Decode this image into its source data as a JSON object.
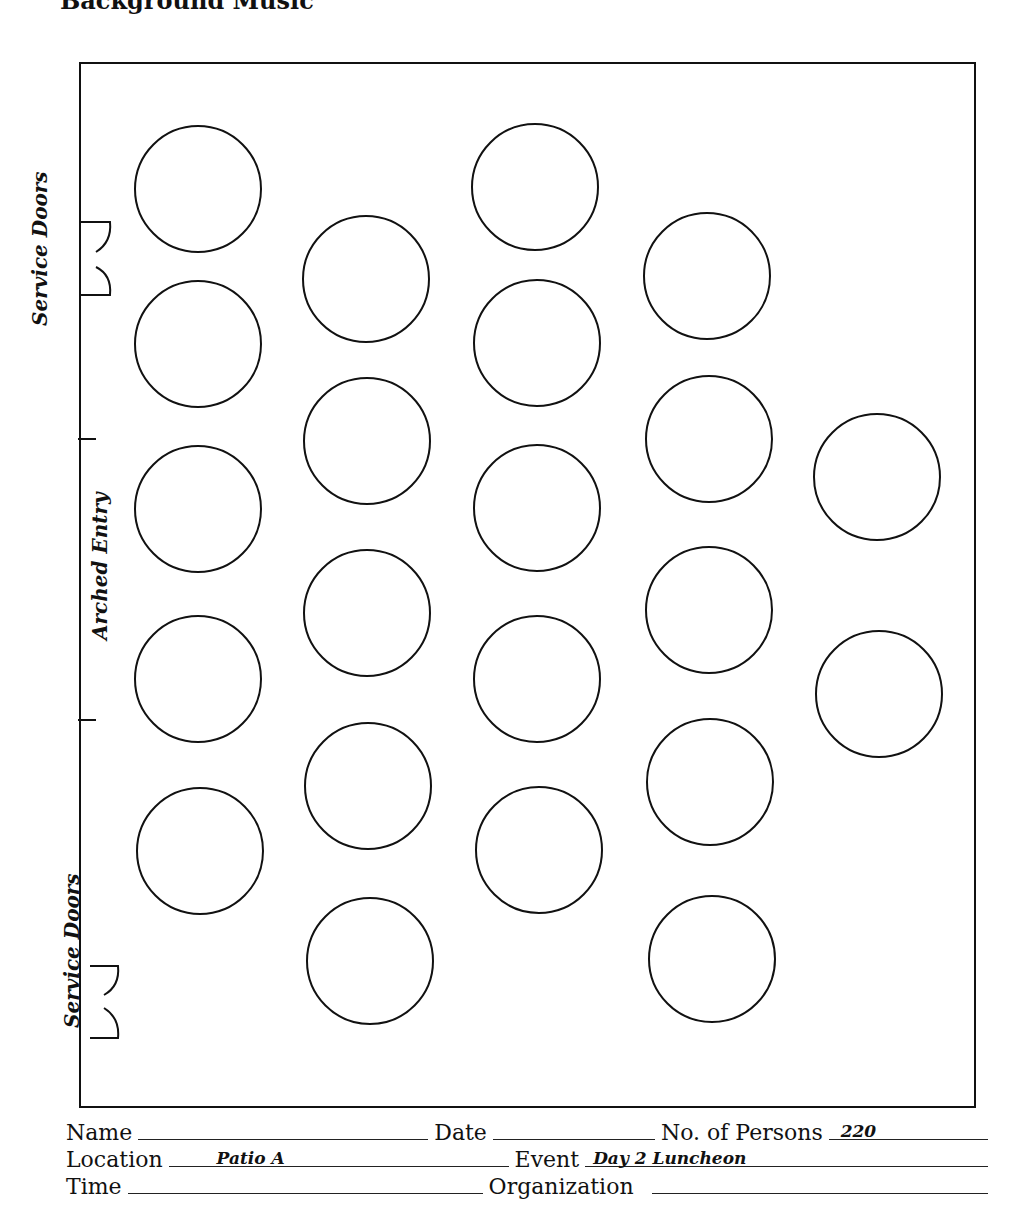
{
  "header": {
    "title": "Background Music"
  },
  "room": {
    "walls": {
      "x1": 80,
      "y1": 63,
      "x2": 975,
      "y2": 1107
    },
    "line_color": "#111111",
    "labels": {
      "service_doors_top": "Service Doors",
      "arched_entry": "Arched Entry",
      "service_doors_bottom": "Service Doors"
    },
    "table_count": 22,
    "tables": [
      {
        "col": 1,
        "cx": 198,
        "cy": 189
      },
      {
        "col": 1,
        "cx": 198,
        "cy": 344
      },
      {
        "col": 1,
        "cx": 198,
        "cy": 509
      },
      {
        "col": 1,
        "cx": 198,
        "cy": 679
      },
      {
        "col": 1,
        "cx": 200,
        "cy": 851
      },
      {
        "col": 2,
        "cx": 366,
        "cy": 279
      },
      {
        "col": 2,
        "cx": 367,
        "cy": 441
      },
      {
        "col": 2,
        "cx": 367,
        "cy": 613
      },
      {
        "col": 2,
        "cx": 368,
        "cy": 786
      },
      {
        "col": 2,
        "cx": 370,
        "cy": 961
      },
      {
        "col": 3,
        "cx": 535,
        "cy": 187
      },
      {
        "col": 3,
        "cx": 537,
        "cy": 343
      },
      {
        "col": 3,
        "cx": 537,
        "cy": 508
      },
      {
        "col": 3,
        "cx": 537,
        "cy": 679
      },
      {
        "col": 3,
        "cx": 539,
        "cy": 850
      },
      {
        "col": 4,
        "cx": 707,
        "cy": 276
      },
      {
        "col": 4,
        "cx": 709,
        "cy": 439
      },
      {
        "col": 4,
        "cx": 709,
        "cy": 610
      },
      {
        "col": 4,
        "cx": 710,
        "cy": 782
      },
      {
        "col": 4,
        "cx": 712,
        "cy": 959
      },
      {
        "col": 5,
        "cx": 877,
        "cy": 477
      },
      {
        "col": 5,
        "cx": 879,
        "cy": 694
      }
    ],
    "table_radius": 63
  },
  "form": {
    "name_label": "Name",
    "name_value": "",
    "date_label": "Date",
    "date_value": "",
    "persons_label": "No. of Persons",
    "persons_value": "220",
    "location_label": "Location",
    "location_value": "Patio A",
    "event_label": "Event",
    "event_value": "Day 2 Luncheon",
    "time_label": "Time",
    "time_value": "",
    "organization_label": "Organization",
    "organization_value": ""
  }
}
